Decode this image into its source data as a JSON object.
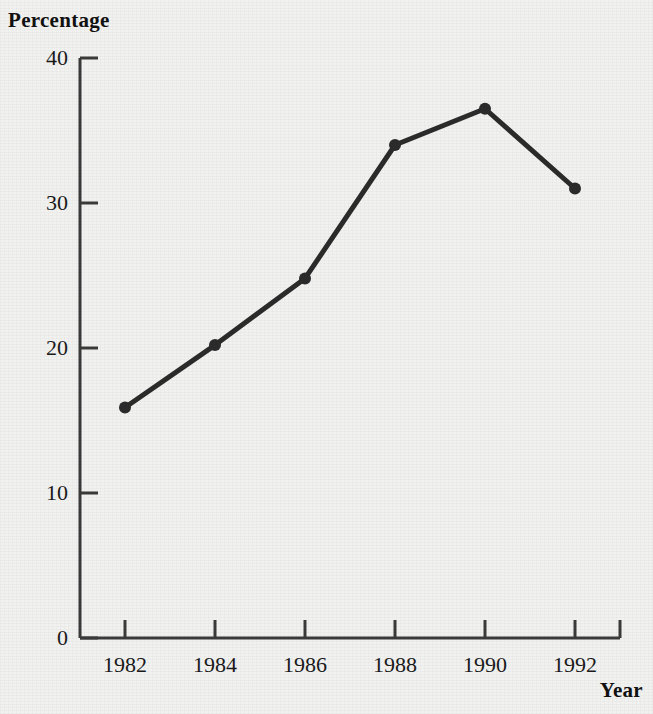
{
  "chart_data": {
    "type": "line",
    "title": "",
    "xlabel": "Year",
    "ylabel": "Percentage",
    "x": [
      1982,
      1984,
      1986,
      1988,
      1990,
      1992
    ],
    "categories": [
      "1982",
      "1984",
      "1986",
      "1988",
      "1990",
      "1992"
    ],
    "values": [
      15.9,
      20.2,
      24.8,
      34.0,
      36.5,
      31.0
    ],
    "series": [
      {
        "name": "Percentage",
        "values": [
          15.9,
          20.2,
          24.8,
          34.0,
          36.5,
          31.0
        ]
      }
    ],
    "xlim": [
      1981,
      1993
    ],
    "ylim": [
      0,
      40
    ],
    "yticks": [
      0,
      10,
      20,
      30,
      40
    ],
    "ytick_labels": [
      "0",
      "10",
      "20",
      "30",
      "40"
    ],
    "xticks": [
      1982,
      1984,
      1986,
      1988,
      1990,
      1992
    ],
    "xtick_labels": [
      "1982",
      "1984",
      "1986",
      "1988",
      "1990",
      "1992"
    ],
    "grid": false,
    "legend": false,
    "legend_position": "none",
    "marker": "circle",
    "line_color": "#2b2b2b",
    "marker_color": "#2b2b2b",
    "axis_color": "#3a3a3a",
    "background_color": "#f1f1f0"
  },
  "labels": {
    "ylabel_title": "Percentage",
    "xlabel_title": "Year"
  }
}
